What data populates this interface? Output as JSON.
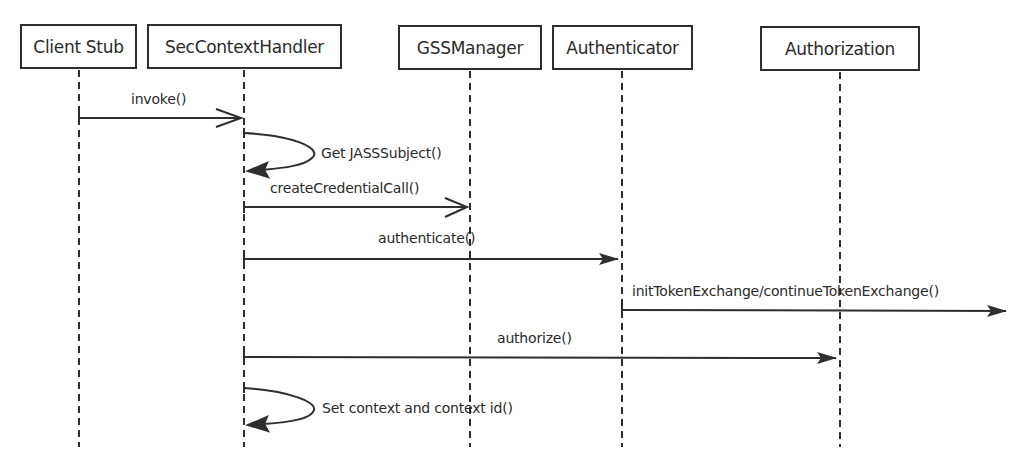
{
  "diagram": {
    "type": "sequence",
    "participants": [
      {
        "name": "Client Stub",
        "box": {
          "x": 20,
          "y": 24,
          "w": 117,
          "h": 45
        },
        "lifeline_x": 79
      },
      {
        "name": "SecContextHandler",
        "box": {
          "x": 147,
          "y": 24,
          "w": 195,
          "h": 45
        },
        "lifeline_x": 244
      },
      {
        "name": "GSSManager",
        "box": {
          "x": 398,
          "y": 25,
          "w": 144,
          "h": 45
        },
        "lifeline_x": 470
      },
      {
        "name": "Authenticator",
        "box": {
          "x": 552,
          "y": 25,
          "w": 141,
          "h": 45
        },
        "lifeline_x": 622
      },
      {
        "name": "Authorization",
        "box": {
          "x": 760,
          "y": 26,
          "w": 160,
          "h": 45
        },
        "lifeline_x": 840
      }
    ],
    "messages": [
      {
        "label": "invoke()",
        "from": "Client Stub",
        "to": "SecContextHandler",
        "kind": "open-arrow"
      },
      {
        "label": "Get JASSSubject()",
        "from": "SecContextHandler",
        "to": "SecContextHandler",
        "kind": "self-call"
      },
      {
        "label": "createCredentialCall()",
        "from": "SecContextHandler",
        "to": "GSSManager",
        "kind": "open-arrow"
      },
      {
        "label": "authenticate()",
        "from": "SecContextHandler",
        "to": "Authenticator",
        "kind": "filled-arrow"
      },
      {
        "label": "initTokenExchange/continueTokenExchange()",
        "from": "Authenticator",
        "to": "(external)",
        "kind": "filled-arrow"
      },
      {
        "label": "authorize()",
        "from": "SecContextHandler",
        "to": "Authorization",
        "kind": "filled-arrow"
      },
      {
        "label": "Set context and context id()",
        "from": "SecContextHandler",
        "to": "SecContextHandler",
        "kind": "self-call"
      }
    ],
    "colors": {
      "line": "#2e2e2e",
      "background": "#ffffff"
    }
  }
}
